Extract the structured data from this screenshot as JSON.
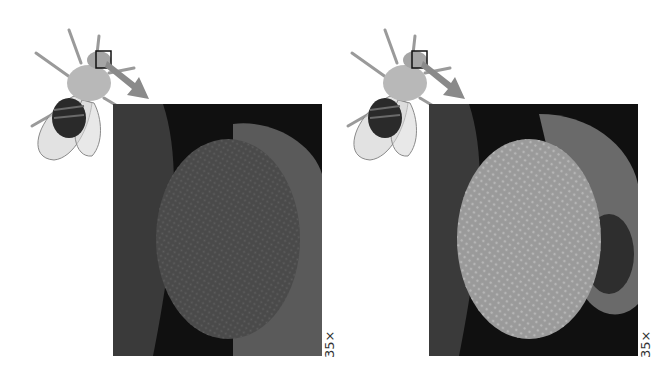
{
  "figures": [
    {
      "id": "left",
      "eye_variant": "smooth-eye",
      "eye_color": "#4a4a4a",
      "magnification_label": "35×"
    },
    {
      "id": "right",
      "eye_variant": "rough-eye",
      "eye_color": "#9a9a9a",
      "magnification_label": "35×"
    }
  ],
  "colors": {
    "arrow": "#8a8a8a",
    "background": "#ffffff",
    "panel_bg": "#0c0c0c"
  }
}
